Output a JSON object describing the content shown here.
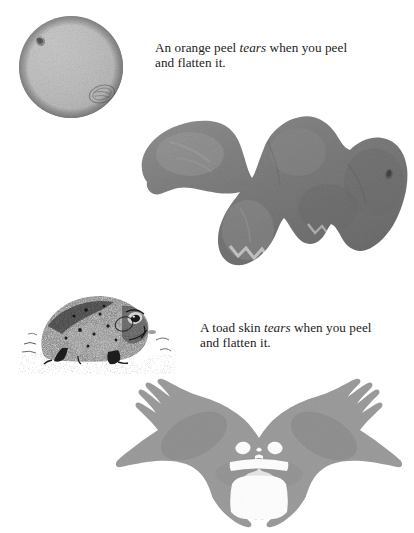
{
  "figure": {
    "background_color": "#ffffff",
    "panels": [
      {
        "id": "orange-panel",
        "caption_line_1_prefix": "An orange peel ",
        "caption_emphasis": "tears",
        "caption_line_1_suffix": " when you peel",
        "caption_line_2": "and flatten it.",
        "subject_label": "whole orange",
        "result_label": "flattened torn orange peel"
      },
      {
        "id": "toad-panel",
        "caption_line_1_prefix": "A toad skin ",
        "caption_emphasis": "tears",
        "caption_line_1_suffix": " when you peel",
        "caption_line_2": "and flatten it.",
        "subject_label": "toad engraving",
        "result_label": "flattened torn toad skin"
      }
    ]
  },
  "captions": {
    "orange": {
      "prefix": "An orange peel ",
      "emphasis": "tears",
      "suffix": " when you peel",
      "line2": "and flatten it."
    },
    "toad": {
      "prefix": "A toad skin ",
      "emphasis": "tears",
      "suffix": " when you peel",
      "line2": "and flatten it."
    }
  },
  "colors": {
    "background": "#ffffff",
    "orange_highlight": "#dcdcdc",
    "orange_midtone": "#b4b4b4",
    "orange_shadow": "#6a6a6a",
    "peel_gray": "#7e7e7e",
    "peel_gray_light": "#8e8e8e",
    "peel_gray_dark": "#6d6d6d",
    "toad_ink": "#222222",
    "toad_skin_gray": "#9c9c9c",
    "toad_skin_gray_dark": "#8d8d8d",
    "text": "#1c1c1c"
  },
  "graphics": {
    "orange": {
      "name": "whole-orange-photo",
      "description": "grayscale photograph of a whole orange sphere with pitted peel texture",
      "stem_dimple": "upper-left",
      "stamp_mark": "lower-right",
      "light_direction": "upper-left"
    },
    "orange_peel": {
      "name": "flattened-orange-peel-photo",
      "description": "irregular gray mass of torn flattened orange peel with three main lobes and ragged edges",
      "lobes": 3
    },
    "toad": {
      "name": "toad-engraving",
      "description": "stippled pen-and-ink engraving of a toad sitting on ground, facing right",
      "facing": "right"
    },
    "toad_skin": {
      "name": "flattened-toad-skin-silhouette",
      "description": "bilaterally symmetric gray silhouette of flattened toad skin with splayed limbs, two white eye holes, white mouth band and white belly gap",
      "eye_holes": 2,
      "limbs": 4
    }
  }
}
